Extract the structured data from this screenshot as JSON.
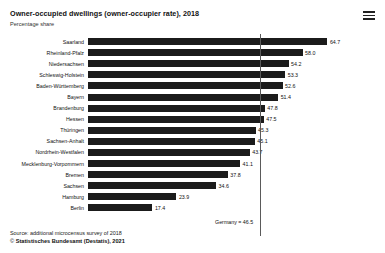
{
  "header": {
    "title": "Owner-occupied dwellings (owner-occupier rate), 2018",
    "subtitle": "Percentage share",
    "menu_icon": "hamburger-menu-icon"
  },
  "footer": {
    "source": "Source: additional microcensus survey of 2018",
    "copyright_mark": "©",
    "copyright": "Statistisches Bundesamt (Destatis), 2021"
  },
  "colors": {
    "bar": "#1b1b1b",
    "reference_line": "#5a5a5a",
    "background": "#ffffff",
    "text": "#111111"
  },
  "chart_data": {
    "type": "bar",
    "orientation": "horizontal",
    "title": "Owner-occupied dwellings (owner-occupier rate), 2018",
    "subtitle": "Percentage share",
    "xlabel": "",
    "ylabel": "",
    "xlim": [
      0,
      70
    ],
    "grid": false,
    "legend": "none",
    "categories": [
      "Saarland",
      "Rheinland-Pfalz",
      "Niedersachsen",
      "Schleswig-Holstein",
      "Baden-Württemberg",
      "Bayern",
      "Brandenburg",
      "Hessen",
      "Thüringen",
      "Sachsen-Anhalt",
      "Nordrhein-Westfalen",
      "Mecklenburg-Vorpommern",
      "Bremen",
      "Sachsen",
      "Hamburg",
      "Berlin"
    ],
    "values": [
      64.7,
      58.0,
      54.2,
      53.3,
      52.6,
      51.4,
      47.8,
      47.5,
      45.3,
      45.1,
      43.7,
      41.1,
      37.8,
      34.6,
      23.9,
      17.4
    ],
    "value_labels": [
      "64.7",
      "58.0",
      "54.2",
      "53.3",
      "52.6",
      "51.4",
      "47.8",
      "47.5",
      "45.3",
      "45.1",
      "43.7",
      "41.1",
      "37.8",
      "34.6",
      "23.9",
      "17.4"
    ],
    "annotations": [
      {
        "type": "reference-line",
        "label": "Germany = 46.5",
        "value": 46.5
      }
    ]
  }
}
